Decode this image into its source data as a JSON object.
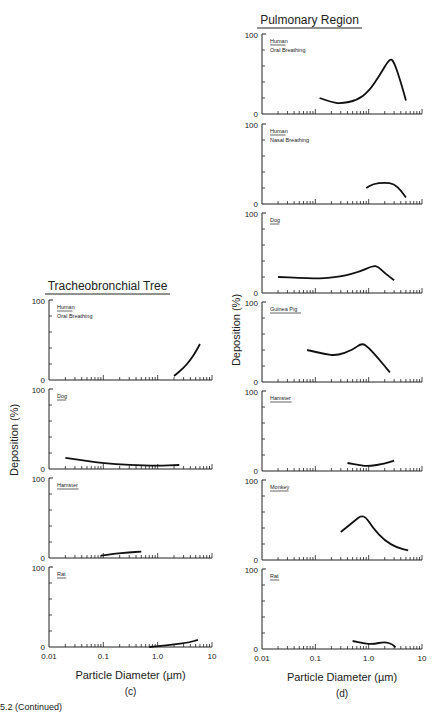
{
  "figure": {
    "caption_fragment": "5.2 (Continued)",
    "panel_c": {
      "title": "Tracheobronchial Tree",
      "label": "(c)",
      "xlabel": "Particle Diameter (µm)",
      "ylabel": "Deposition (%)"
    },
    "panel_d": {
      "title": "Pulmonary Region",
      "label": "(d)",
      "xlabel": "Particle Diameter (µm)",
      "ylabel": "Deposition (%)"
    },
    "x_ticks": [
      "0.01",
      "0.1",
      "1.0",
      "10"
    ],
    "y_ticks": [
      "0",
      "100"
    ]
  },
  "chart_data": [
    {
      "type": "line",
      "title": "Tracheobronchial Tree",
      "panel": "(c)",
      "xlabel": "Particle Diameter (µm)",
      "ylabel": "Deposition (%)",
      "xscale": "log",
      "xlim": [
        0.01,
        10
      ],
      "ylim": [
        0,
        100
      ],
      "series": [
        {
          "name": "Human Oral Breathing",
          "x": [
            2,
            3,
            4,
            5,
            6
          ],
          "values": [
            5,
            15,
            25,
            35,
            45
          ]
        },
        {
          "name": "Dog",
          "x": [
            0.02,
            0.05,
            0.1,
            0.3,
            1.0,
            2.5
          ],
          "values": [
            14,
            10,
            7,
            5,
            4,
            5
          ]
        },
        {
          "name": "Hamster",
          "x": [
            0.09,
            0.15,
            0.3,
            0.5
          ],
          "values": [
            3,
            5,
            7,
            8
          ]
        },
        {
          "name": "Rat",
          "x": [
            0.7,
            1.0,
            2.0,
            4.0,
            5.5
          ],
          "values": [
            0,
            1,
            3,
            6,
            9
          ]
        }
      ]
    },
    {
      "type": "line",
      "title": "Pulmonary Region",
      "panel": "(d)",
      "xlabel": "Particle Diameter (µm)",
      "ylabel": "Deposition (%)",
      "xscale": "log",
      "xlim": [
        0.01,
        10
      ],
      "ylim": [
        0,
        100
      ],
      "series": [
        {
          "name": "Human Oral Breathing",
          "x": [
            0.12,
            0.2,
            0.3,
            0.6,
            1.0,
            1.6,
            2.5,
            3.0,
            4.0,
            5.0
          ],
          "values": [
            20,
            15,
            13,
            17,
            28,
            48,
            70,
            65,
            40,
            17
          ]
        },
        {
          "name": "Human Nasal Breathing",
          "x": [
            0.9,
            1.2,
            2.0,
            3.0,
            4.0,
            5.0
          ],
          "values": [
            20,
            25,
            27,
            25,
            17,
            8
          ]
        },
        {
          "name": "Dog",
          "x": [
            0.02,
            0.05,
            0.1,
            0.3,
            0.7,
            1.2,
            1.5,
            2.0,
            3.0
          ],
          "values": [
            20,
            19,
            18,
            20,
            27,
            34,
            33,
            25,
            16
          ]
        },
        {
          "name": "Guinea Pig",
          "x": [
            0.07,
            0.15,
            0.25,
            0.5,
            0.75,
            1.0,
            1.5,
            2.5
          ],
          "values": [
            40,
            35,
            33,
            40,
            49,
            43,
            30,
            12
          ]
        },
        {
          "name": "Hamster",
          "x": [
            0.4,
            0.7,
            1.0,
            2.0,
            3.0
          ],
          "values": [
            10,
            7,
            6,
            9,
            13
          ]
        },
        {
          "name": "Monkey",
          "x": [
            0.3,
            0.5,
            0.8,
            1.2,
            2.0,
            3.5,
            5.5
          ],
          "values": [
            35,
            47,
            58,
            40,
            24,
            15,
            12
          ]
        },
        {
          "name": "Rat",
          "x": [
            0.5,
            0.8,
            1.2,
            2.0,
            2.8,
            3.2
          ],
          "values": [
            10,
            7,
            6,
            9,
            6,
            2
          ]
        }
      ]
    }
  ]
}
